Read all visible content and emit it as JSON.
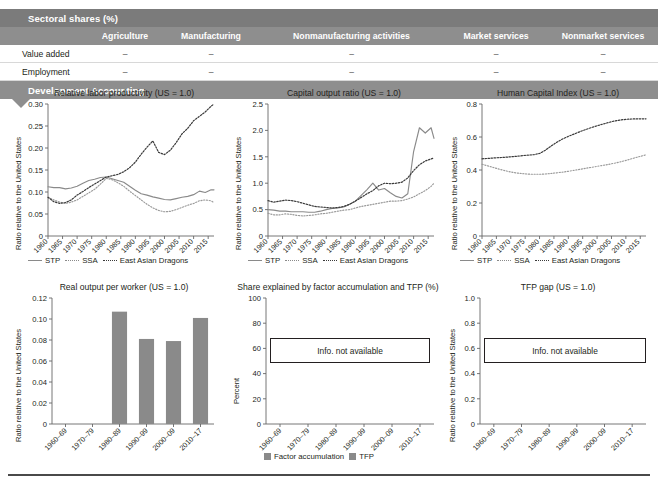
{
  "table": {
    "section_title": "Sectoral shares (%)",
    "columns": [
      "Agriculture",
      "Manufacturing",
      "Nonmanufacturing activities",
      "Market services",
      "Nonmarket services"
    ],
    "rows": [
      {
        "label": "Value added",
        "values": [
          "–",
          "–",
          "–",
          "–",
          "–"
        ]
      },
      {
        "label": "Employment",
        "values": [
          "–",
          "–",
          "–",
          "–",
          "–"
        ]
      }
    ],
    "dev_band_title": "Development Accounting"
  },
  "legend_lines": {
    "stp": "STP",
    "ssa": "SSA",
    "ead": "East Asian Dragons"
  },
  "legend_bars": {
    "factor": "Factor accumulation",
    "tfp": "TFP"
  },
  "na_text": "Info. not available",
  "colors": {
    "band_dark": "#7b7b7b",
    "band_mid": "#8e8e8e",
    "bar_gray": "#8a8a8a",
    "stp_line": "#8a8a8a",
    "ssa_line": "#9a9a9a",
    "ead_line": "#3a3a3a"
  },
  "chart_data": [
    {
      "type": "line",
      "id": "relative-labor-productivity",
      "title": "Relative labor productivity (US = 1.0)",
      "xlabel": "",
      "ylabel": "Ratio relative to the United States",
      "ylim": [
        0,
        0.3
      ],
      "yticks": [
        0,
        0.05,
        0.1,
        0.15,
        0.2,
        0.25,
        0.3
      ],
      "ytick_labels": [
        "0",
        "0.05",
        "0.10",
        "0.15",
        "0.20",
        "0.25",
        "0.30"
      ],
      "xlim": [
        1960,
        2017
      ],
      "xticks": [
        1960,
        1965,
        1970,
        1975,
        1980,
        1985,
        1990,
        1995,
        2000,
        2005,
        2010,
        2015
      ],
      "xtick_labels": [
        "1960",
        "1965",
        "1970",
        "1975",
        "1980",
        "1985",
        "1990",
        "1995",
        "2000",
        "2005",
        "2010",
        "2015"
      ],
      "grid": false,
      "legend_position": "bottom",
      "x": [
        1960,
        1962,
        1964,
        1966,
        1968,
        1970,
        1972,
        1974,
        1976,
        1978,
        1980,
        1982,
        1984,
        1986,
        1988,
        1990,
        1992,
        1994,
        1996,
        1998,
        2000,
        2002,
        2004,
        2006,
        2008,
        2010,
        2012,
        2014,
        2016,
        2017
      ],
      "series": [
        {
          "name": "STP",
          "style": "solid",
          "values": [
            0.112,
            0.11,
            0.11,
            0.107,
            0.109,
            0.113,
            0.12,
            0.126,
            0.129,
            0.133,
            0.134,
            0.13,
            0.126,
            0.122,
            0.113,
            0.104,
            0.096,
            0.093,
            0.089,
            0.086,
            0.083,
            0.082,
            0.085,
            0.088,
            0.09,
            0.094,
            0.102,
            0.099,
            0.105,
            0.105
          ]
        },
        {
          "name": "SSA",
          "style": "dotted-fine",
          "values": [
            0.088,
            0.082,
            0.077,
            0.074,
            0.077,
            0.082,
            0.09,
            0.098,
            0.106,
            0.118,
            0.131,
            0.128,
            0.121,
            0.113,
            0.102,
            0.092,
            0.082,
            0.072,
            0.064,
            0.058,
            0.055,
            0.056,
            0.06,
            0.065,
            0.07,
            0.074,
            0.08,
            0.082,
            0.08,
            0.076
          ]
        },
        {
          "name": "East Asian Dragons",
          "style": "dotted-wide",
          "values": [
            0.088,
            0.078,
            0.074,
            0.076,
            0.082,
            0.093,
            0.101,
            0.11,
            0.118,
            0.126,
            0.134,
            0.137,
            0.14,
            0.146,
            0.155,
            0.168,
            0.186,
            0.202,
            0.216,
            0.19,
            0.185,
            0.195,
            0.212,
            0.232,
            0.245,
            0.262,
            0.272,
            0.282,
            0.295,
            0.3
          ]
        }
      ]
    },
    {
      "type": "line",
      "id": "capital-output-ratio",
      "title": "Capital output ratio (US = 1.0)",
      "xlabel": "",
      "ylabel": "Ratio relative to the United States",
      "ylim": [
        0,
        2.5
      ],
      "yticks": [
        0,
        0.5,
        1.0,
        1.5,
        2.0,
        2.5
      ],
      "ytick_labels": [
        "0",
        "0.5",
        "1.0",
        "1.5",
        "2.0",
        "2.5"
      ],
      "xlim": [
        1960,
        2017
      ],
      "xticks": [
        1960,
        1965,
        1970,
        1975,
        1980,
        1985,
        1990,
        1995,
        2000,
        2005,
        2010,
        2015
      ],
      "xtick_labels": [
        "1960",
        "1965",
        "1970",
        "1975",
        "1980",
        "1985",
        "1990",
        "1995",
        "2000",
        "2005",
        "2010",
        "2015"
      ],
      "grid": false,
      "legend_position": "bottom",
      "x": [
        1960,
        1962,
        1964,
        1966,
        1968,
        1970,
        1972,
        1974,
        1976,
        1978,
        1980,
        1982,
        1984,
        1986,
        1988,
        1990,
        1992,
        1994,
        1996,
        1998,
        2000,
        2002,
        2004,
        2006,
        2008,
        2010,
        2012,
        2014,
        2016,
        2017
      ],
      "series": [
        {
          "name": "STP",
          "style": "solid",
          "values": [
            0.5,
            0.49,
            0.47,
            0.47,
            0.46,
            0.46,
            0.46,
            0.45,
            0.45,
            0.47,
            0.5,
            0.52,
            0.53,
            0.55,
            0.6,
            0.66,
            0.77,
            0.88,
            1.0,
            0.87,
            0.9,
            0.82,
            0.75,
            0.72,
            0.8,
            1.6,
            2.05,
            1.95,
            2.05,
            1.85
          ]
        },
        {
          "name": "SSA",
          "style": "dotted-fine",
          "values": [
            0.43,
            0.4,
            0.4,
            0.42,
            0.41,
            0.39,
            0.38,
            0.39,
            0.4,
            0.42,
            0.43,
            0.45,
            0.47,
            0.49,
            0.5,
            0.53,
            0.56,
            0.58,
            0.6,
            0.62,
            0.64,
            0.66,
            0.66,
            0.67,
            0.7,
            0.74,
            0.8,
            0.86,
            0.94,
            1.0
          ]
        },
        {
          "name": "East Asian Dragons",
          "style": "dotted-wide",
          "values": [
            0.67,
            0.64,
            0.66,
            0.68,
            0.67,
            0.65,
            0.62,
            0.59,
            0.56,
            0.55,
            0.54,
            0.53,
            0.54,
            0.56,
            0.6,
            0.66,
            0.73,
            0.8,
            0.86,
            0.95,
            1.0,
            0.99,
            1.0,
            1.02,
            1.1,
            1.24,
            1.35,
            1.42,
            1.46,
            1.48
          ]
        }
      ]
    },
    {
      "type": "line",
      "id": "human-capital-index",
      "title": "Human Capital Index (US = 1.0)",
      "xlabel": "",
      "ylabel": "Ratio relative to the United States",
      "ylim": [
        0,
        0.8
      ],
      "yticks": [
        0,
        0.2,
        0.4,
        0.6,
        0.8
      ],
      "ytick_labels": [
        "0",
        "0.2",
        "0.4",
        "0.6",
        "0.8"
      ],
      "xlim": [
        1960,
        2017
      ],
      "xticks": [
        1960,
        1965,
        1970,
        1975,
        1980,
        1985,
        1990,
        1995,
        2000,
        2005,
        2010,
        2015
      ],
      "xtick_labels": [
        "1960",
        "1965",
        "1970",
        "1975",
        "1980",
        "1985",
        "1990",
        "1995",
        "2000",
        "2005",
        "2010",
        "2015"
      ],
      "grid": false,
      "legend_position": "bottom",
      "x": [
        1960,
        1962,
        1964,
        1966,
        1968,
        1970,
        1972,
        1974,
        1976,
        1978,
        1980,
        1982,
        1984,
        1986,
        1988,
        1990,
        1992,
        1994,
        1996,
        1998,
        2000,
        2002,
        2004,
        2006,
        2008,
        2010,
        2012,
        2014,
        2016,
        2017
      ],
      "series": [
        {
          "name": "STP",
          "style": "solid",
          "values": []
        },
        {
          "name": "SSA",
          "style": "dotted-fine",
          "values": [
            0.435,
            0.425,
            0.415,
            0.405,
            0.396,
            0.388,
            0.382,
            0.378,
            0.375,
            0.374,
            0.374,
            0.376,
            0.379,
            0.383,
            0.387,
            0.392,
            0.398,
            0.404,
            0.41,
            0.416,
            0.422,
            0.428,
            0.434,
            0.441,
            0.449,
            0.458,
            0.468,
            0.478,
            0.487,
            0.492
          ]
        },
        {
          "name": "East Asian Dragons",
          "style": "dotted-wide",
          "values": [
            0.468,
            0.47,
            0.473,
            0.475,
            0.477,
            0.48,
            0.483,
            0.487,
            0.49,
            0.493,
            0.5,
            0.52,
            0.545,
            0.568,
            0.588,
            0.604,
            0.618,
            0.632,
            0.645,
            0.657,
            0.668,
            0.678,
            0.688,
            0.697,
            0.703,
            0.707,
            0.709,
            0.71,
            0.71,
            0.71
          ]
        }
      ]
    },
    {
      "type": "bar",
      "id": "real-output-per-worker",
      "title": "Real output per worker (US = 1.0)",
      "xlabel": "",
      "ylabel": "Ratio relative to the United States",
      "ylim": [
        0,
        0.12
      ],
      "yticks": [
        0,
        0.02,
        0.04,
        0.06,
        0.08,
        0.1,
        0.12
      ],
      "ytick_labels": [
        "0",
        "0.02",
        "0.04",
        "0.06",
        "0.08",
        "0.10",
        "0.12"
      ],
      "categories": [
        "1960–69",
        "1970–79",
        "1980–89",
        "1990–99",
        "2000–09",
        "2010–17"
      ],
      "values": [
        null,
        null,
        0.107,
        0.081,
        0.079,
        0.101
      ],
      "grid": false,
      "legend_position": "none"
    },
    {
      "type": "bar",
      "id": "share-factor-accumulation-tfp",
      "title": "Share explained by factor accumulation and TFP (%)",
      "xlabel": "",
      "ylabel": "Percent",
      "ylim": [
        0,
        100
      ],
      "yticks": [
        0,
        20,
        40,
        60,
        80,
        100
      ],
      "ytick_labels": [
        "0",
        "20",
        "40",
        "60",
        "80",
        "100"
      ],
      "categories": [
        "1960–69",
        "1970–79",
        "1980–89",
        "1990–99",
        "2000–09",
        "2010–17"
      ],
      "series": [
        {
          "name": "Factor accumulation",
          "values": [
            null,
            null,
            null,
            null,
            null,
            null
          ]
        },
        {
          "name": "TFP",
          "values": [
            null,
            null,
            null,
            null,
            null,
            null
          ]
        }
      ],
      "annotation": "Info. not available",
      "grid": false,
      "legend_position": "bottom"
    },
    {
      "type": "bar",
      "id": "tfp-gap",
      "title": "TFP gap (US = 1.0)",
      "xlabel": "",
      "ylabel": "Ratio relative to the United States",
      "ylim": [
        0,
        1.0
      ],
      "yticks": [
        0,
        0.2,
        0.4,
        0.6,
        0.8,
        1.0
      ],
      "ytick_labels": [
        "0",
        "0.2",
        "0.4",
        "0.6",
        "0.8",
        "1.0"
      ],
      "categories": [
        "1960–69",
        "1970–79",
        "1980–89",
        "1990–99",
        "2000–09",
        "2010–17"
      ],
      "values": [
        null,
        null,
        null,
        null,
        null,
        null
      ],
      "annotation": "Info. not available",
      "grid": false,
      "legend_position": "none"
    }
  ]
}
